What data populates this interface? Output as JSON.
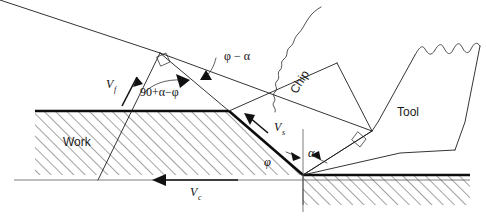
{
  "figure": {
    "background_color": "#ffffff",
    "line_color": "#1d1d1d",
    "accent_color": "#0d0d0d"
  },
  "labels": {
    "work": "Work",
    "chip": "Chip",
    "tool": "Tool"
  },
  "velocities": {
    "cutting": {
      "symbol": "V",
      "subscript": "c",
      "name": "cutting-velocity"
    },
    "chip_flow": {
      "symbol": "V",
      "subscript": "f",
      "name": "chip-flow-velocity"
    },
    "shear": {
      "symbol": "V",
      "subscript": "s",
      "name": "shear-velocity"
    }
  },
  "angles": {
    "shear_angle": "φ",
    "rake_angle": "α",
    "phi_minus_alpha": "φ − α",
    "ninety_plus_alpha_minus_phi": "90+α−φ"
  },
  "annotations": {
    "right_angle_marker_1": "right-angle",
    "right_angle_marker_2": "right-angle"
  }
}
